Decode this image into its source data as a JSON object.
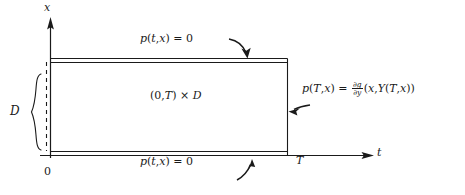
{
  "figure": {
    "kind": "math-diagram",
    "background_color": "#ffffff",
    "line_color": "#1a1a1a"
  },
  "axes": {
    "vertical": {
      "name": "x-axis",
      "label": "x"
    },
    "horizontal": {
      "name": "t-axis",
      "label": "t"
    },
    "origin_label": "0"
  },
  "ticks": {
    "t_terminal": "T"
  },
  "braces": {
    "domain_extent": {
      "label": "D",
      "describes": "spatial domain D on the x-axis"
    }
  },
  "region": {
    "label_parts": {
      "interval": "(0,",
      "terminal": "T",
      "close": ")",
      "times": "×",
      "domain": "D"
    },
    "label_text": "(0,T) × D"
  },
  "boundary_conditions": {
    "top": {
      "name": "top-boundary-condition",
      "text": "p(t,x) = 0",
      "parts": {
        "fn": "p",
        "open": "(",
        "arg1": "t",
        "comma": ",",
        "arg2": "x",
        "close": ")",
        "eq": "=",
        "value": "0"
      }
    },
    "bottom": {
      "name": "bottom-boundary-condition",
      "text": "p(t,x) = 0",
      "parts": {
        "fn": "p",
        "open": "(",
        "arg1": "t",
        "comma": ",",
        "arg2": "x",
        "close": ")",
        "eq": "=",
        "value": "0"
      }
    },
    "terminal": {
      "name": "terminal-condition",
      "text": "p(T,x) = ∂g/∂y(x, Y(T,x))",
      "parts": {
        "fn": "p",
        "open": "(",
        "arg1": "T",
        "comma": ",",
        "arg2": "x",
        "close": ")",
        "eq": "=",
        "frac_num_d": "∂",
        "frac_num_var": "g",
        "frac_den_d": "∂",
        "frac_den_var": "y",
        "rhs_open": "(",
        "rhs_arg1": "x",
        "rhs_comma": ",",
        "rhs_fn": "Y",
        "rhs_inner_open": "(",
        "rhs_inner_1": "T",
        "rhs_inner_comma": ",",
        "rhs_inner_2": "x",
        "rhs_inner_close": ")",
        "rhs_close": ")"
      }
    }
  },
  "pointers": [
    {
      "name": "pointer-top",
      "points_to": "top boundary of rectangle"
    },
    {
      "name": "pointer-right",
      "points_to": "right (terminal) edge of rectangle"
    },
    {
      "name": "pointer-bottom",
      "points_to": "bottom boundary of rectangle"
    }
  ]
}
